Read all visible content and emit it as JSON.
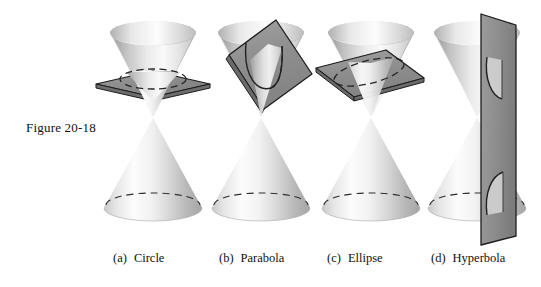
{
  "figure": {
    "label": "Figure 20-18",
    "background_color": "#ffffff",
    "ink_color": "#111111",
    "plane_color": "#8a8a8a",
    "plane_edge_color": "#1d1d1d",
    "cone_light_color": "#fbfbfb",
    "cone_mid_color": "#d2d2d2",
    "cone_shadow_color": "#9a9a9a",
    "dashed_curve_color": "#2a2a2a"
  },
  "panels": [
    {
      "id": "circle",
      "tag": "(a)",
      "name": "Circle",
      "plane_orientation": "horizontal",
      "intersection_curve": "closed ellipse shown as dashed circle"
    },
    {
      "id": "parabola",
      "tag": "(b)",
      "name": "Parabola",
      "plane_orientation": "tilted parallel to a slant edge",
      "intersection_curve": "open U-shaped curve"
    },
    {
      "id": "ellipse",
      "tag": "(c)",
      "name": "Ellipse",
      "plane_orientation": "oblique",
      "intersection_curve": "closed elongated ellipse"
    },
    {
      "id": "hyperbola",
      "tag": "(d)",
      "name": "Hyperbola",
      "plane_orientation": "vertical",
      "intersection_curve": "two opposing branches, one on each nappe"
    }
  ]
}
